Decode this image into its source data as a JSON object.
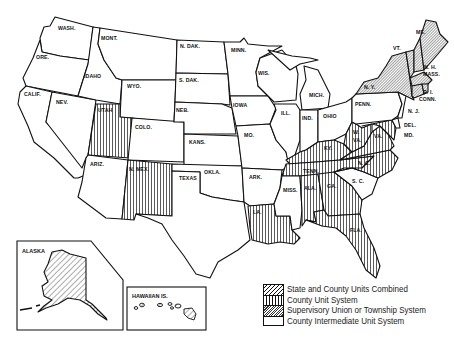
{
  "map": {
    "title": "",
    "legend": [
      {
        "pattern": "diagonal-hatch",
        "label": "State and County Units Combined"
      },
      {
        "pattern": "vertical-lines",
        "label": "County Unit System"
      },
      {
        "pattern": "dense-hatch",
        "label": "Supervisory Union or Township System"
      },
      {
        "pattern": "plain",
        "label": "County Intermediate Unit System"
      }
    ],
    "states": {
      "wash": "WASH.",
      "ore": "ORE.",
      "calif": "CALIF.",
      "idaho": "IDAHO",
      "nev": "NEV.",
      "mont": "MONT.",
      "wyo": "WYO.",
      "utah": "UTAH",
      "ariz": "ARIZ.",
      "colo": "COLO.",
      "nmex": "N. MEX.",
      "ndak": "N. DAK.",
      "sdak": "S. DAK.",
      "neb": "NEB.",
      "kans": "KANS.",
      "okla": "OKLA.",
      "texas": "TEXAS",
      "minn": "MINN.",
      "iowa": "IOWA",
      "mo": "MO.",
      "ark": "ARK.",
      "la": "LA.",
      "wis": "WIS.",
      "ill": "ILL.",
      "mich": "MICH.",
      "ind": "IND.",
      "ohio": "OHIO",
      "ky": "KY.",
      "tenn": "TENN.",
      "miss": "MISS.",
      "ala": "ALA.",
      "ga": "GA.",
      "fla": "FLA.",
      "sc": "S. C.",
      "nc": "N. C.",
      "va": "VA.",
      "wva_w": "W.",
      "wva_va": "VA.",
      "penn": "PENN.",
      "ny": "N. Y.",
      "vt": "VT.",
      "nh": "N. H.",
      "me": "ME.",
      "mass": "MASS.",
      "ri": "R. I.",
      "conn": "CONN.",
      "nj": "N. J.",
      "del": "DEL.",
      "md": "MD."
    },
    "insets": {
      "alaska": "ALASKA",
      "hawaii": "HAWAIIAN IS."
    },
    "classification": {
      "state_and_county_combined": [
        "Alaska",
        "Hawaii"
      ],
      "county_unit": [
        "Utah",
        "New Mexico",
        "Louisiana",
        "Kentucky",
        "Tennessee",
        "Alabama",
        "Georgia",
        "Florida",
        "West Virginia",
        "Virginia",
        "North Carolina",
        "Maryland"
      ],
      "supervisory_union_or_township": [
        "New York",
        "Vermont",
        "New Hampshire",
        "Maine",
        "Massachusetts",
        "Rhode Island",
        "Connecticut"
      ],
      "county_intermediate": [
        "Washington",
        "Oregon",
        "California",
        "Idaho",
        "Nevada",
        "Montana",
        "Wyoming",
        "Arizona",
        "Colorado",
        "North Dakota",
        "South Dakota",
        "Nebraska",
        "Kansas",
        "Oklahoma",
        "Texas",
        "Minnesota",
        "Iowa",
        "Missouri",
        "Arkansas",
        "Wisconsin",
        "Illinois",
        "Michigan",
        "Indiana",
        "Ohio",
        "Mississippi",
        "South Carolina",
        "Pennsylvania",
        "New Jersey",
        "Delaware"
      ]
    },
    "colors": {
      "ink": "#111111",
      "paper": "#ffffff"
    }
  }
}
